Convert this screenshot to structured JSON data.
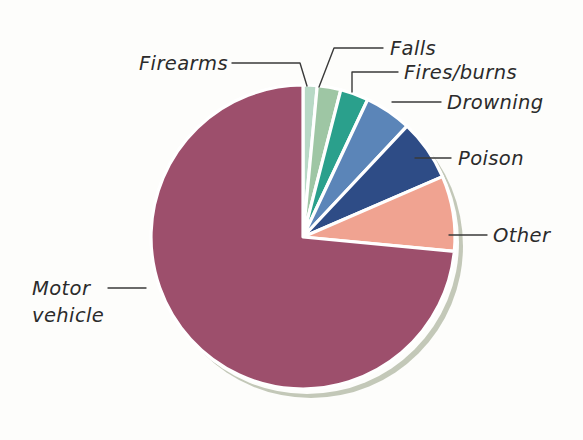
{
  "chart_data": {
    "type": "pie",
    "title": "",
    "subtitle": "",
    "xlabel": "",
    "ylabel": "",
    "legend_position": "none",
    "grid": false,
    "labels_position": "outside-with-leader-lines",
    "start_angle_deg": 0,
    "direction": "clockwise",
    "categories": [
      "Firearms",
      "Falls",
      "Fires/burns",
      "Drowning",
      "Poison",
      "Other",
      "Motor vehicle"
    ],
    "values": [
      1.5,
      2.5,
      3.0,
      5.0,
      6.5,
      8.0,
      73.5
    ],
    "unit": "percent",
    "colors": [
      "#b8d9c6",
      "#9ec6a4",
      "#2aa08c",
      "#5b85b8",
      "#2e4c86",
      "#f0a391",
      "#9d4f6c"
    ],
    "slices": [
      {
        "label": "Firearms",
        "value": 1.5,
        "color": "#b8d9c6"
      },
      {
        "label": "Falls",
        "value": 2.5,
        "color": "#9ec6a4"
      },
      {
        "label": "Fires/burns",
        "value": 3.0,
        "color": "#2aa08c"
      },
      {
        "label": "Drowning",
        "value": 5.0,
        "color": "#5b85b8"
      },
      {
        "label": "Poison",
        "value": 6.5,
        "color": "#2e4c86"
      },
      {
        "label": "Other",
        "value": 8.0,
        "color": "#f0a391"
      },
      {
        "label": "Motor vehicle",
        "value": 73.5,
        "color": "#9d4f6c"
      }
    ]
  },
  "labels": {
    "firearms": "Firearms",
    "falls": "Falls",
    "fires_burns": "Fires/burns",
    "drowning": "Drowning",
    "poison": "Poison",
    "other": "Other",
    "motor_vehicle_line1": "Motor",
    "motor_vehicle_line2": "vehicle"
  },
  "style": {
    "background": "#fdfdfb",
    "slice_border": "#ffffff",
    "shadow_color": "#c3c8b8",
    "text_color": "#2b2b2b",
    "leader_color": "#3a3a3a"
  }
}
